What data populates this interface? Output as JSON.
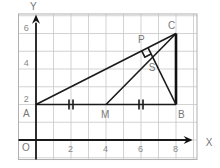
{
  "figure": {
    "axes": {
      "x_label": "X",
      "y_label": "Y",
      "origin_label": "O"
    },
    "x_ticks": [
      {
        "value": 2,
        "label": "2"
      },
      {
        "value": 4,
        "label": "4"
      },
      {
        "value": 6,
        "label": "6"
      },
      {
        "value": 8,
        "label": "8"
      }
    ],
    "y_ticks": [
      {
        "value": 2,
        "label": "2"
      },
      {
        "value": 4,
        "label": "4"
      },
      {
        "value": 6,
        "label": "6"
      }
    ],
    "grid": {
      "x_min": -1,
      "x_max": 9.2,
      "y_min": -1.1,
      "y_max": 7.1,
      "step": 1
    },
    "points": {
      "A": {
        "label": "A",
        "x": 0,
        "y": 2
      },
      "B": {
        "label": "B",
        "x": 8,
        "y": 2
      },
      "C": {
        "label": "C",
        "x": 8,
        "y": 6
      },
      "M": {
        "label": "M",
        "x": 4,
        "y": 2
      },
      "P": {
        "label": "P",
        "x": 6.4,
        "y": 5.2
      },
      "S": {
        "label": "S",
        "x": 6.667,
        "y": 4.667
      }
    },
    "segments": [
      [
        "A",
        "B"
      ],
      [
        "A",
        "C"
      ],
      [
        "B",
        "C"
      ],
      [
        "M",
        "C"
      ],
      [
        "B",
        "P"
      ]
    ],
    "equal_marks": [
      {
        "x": 2,
        "y": 2
      },
      {
        "x": 6,
        "y": 2
      }
    ],
    "right_angle_at": "P"
  }
}
